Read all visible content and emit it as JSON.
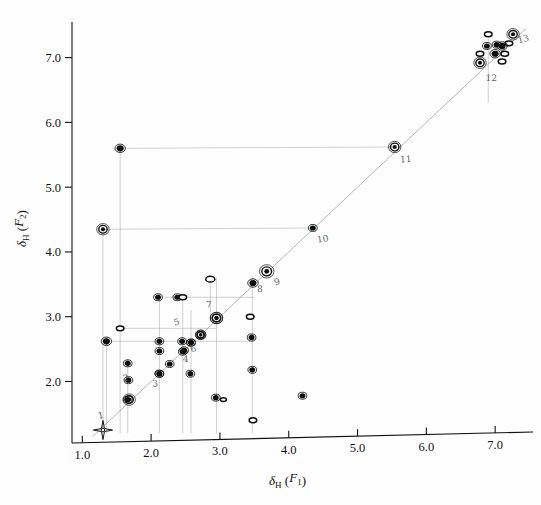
{
  "figure": {
    "background_color": "#fefefe",
    "ink_color": "#0d0d0d",
    "guide_color": "#9a9a9a",
    "width": 541,
    "height": 505
  },
  "axes": {
    "x": {
      "label_main": "δ",
      "label_sub": "H",
      "label_paren_open": " (",
      "label_italic": "F",
      "label_italic_sub": "1",
      "label_paren_close": ")",
      "label_text": "δH (F1)",
      "ticks": [
        "1.0",
        "2.0",
        "3.0",
        "4.0",
        "5.0",
        "6.0",
        "7.0"
      ],
      "tick_values": [
        1.0,
        2.0,
        3.0,
        4.0,
        5.0,
        6.0,
        7.0
      ],
      "range": [
        0.85,
        7.55
      ]
    },
    "y": {
      "label_main": "δ",
      "label_sub": "H",
      "label_paren_open": " (",
      "label_italic": "F",
      "label_italic_sub": "2",
      "label_paren_close": ")",
      "label_text": "δH (F2)",
      "ticks": [
        "7.0",
        "6.0",
        "5.0",
        "4.0",
        "3.0",
        "2.0"
      ],
      "tick_values": [
        7.0,
        6.0,
        5.0,
        4.0,
        3.0,
        2.0
      ],
      "range": [
        1.05,
        7.55
      ]
    }
  },
  "chart_data": {
    "type": "scatter",
    "xlabel": "δH (F1)",
    "ylabel": "δH (F2)",
    "xlim": [
      0.85,
      7.55
    ],
    "ylim": [
      1.05,
      7.55
    ],
    "grid": false,
    "legend": null,
    "diagonal": {
      "from": [
        1.15,
        1.15
      ],
      "to": [
        7.45,
        7.45
      ]
    },
    "series": [
      {
        "name": "diagonal-peaks",
        "style": "filled-ring",
        "points": [
          {
            "x": 1.3,
            "y": 1.25,
            "size": 9,
            "kind": "star"
          },
          {
            "x": 1.68,
            "y": 1.72,
            "size": 6,
            "kind": "ring"
          },
          {
            "x": 2.12,
            "y": 2.12,
            "size": 5,
            "kind": "solid"
          },
          {
            "x": 2.27,
            "y": 2.27,
            "size": 5,
            "kind": "solid"
          },
          {
            "x": 2.46,
            "y": 2.46,
            "size": 5,
            "kind": "solid"
          },
          {
            "x": 2.58,
            "y": 2.6,
            "size": 5,
            "kind": "solid"
          },
          {
            "x": 2.72,
            "y": 2.72,
            "size": 5,
            "kind": "ring"
          },
          {
            "x": 2.95,
            "y": 2.98,
            "size": 6,
            "kind": "ring"
          },
          {
            "x": 3.48,
            "y": 3.52,
            "size": 6,
            "kind": "solid"
          },
          {
            "x": 3.68,
            "y": 3.7,
            "size": 7,
            "kind": "ring"
          },
          {
            "x": 4.35,
            "y": 4.37,
            "size": 5,
            "kind": "solid",
            "label": "10"
          },
          {
            "x": 5.54,
            "y": 5.62,
            "size": 6,
            "kind": "ring",
            "label": "11"
          },
          {
            "x": 6.78,
            "y": 6.92,
            "size": 6,
            "kind": "ring",
            "label": "12"
          },
          {
            "x": 7.0,
            "y": 7.06,
            "size": 6,
            "kind": "solid"
          },
          {
            "x": 7.1,
            "y": 7.18,
            "size": 6,
            "kind": "solid"
          },
          {
            "x": 7.26,
            "y": 7.36,
            "size": 6,
            "kind": "ring"
          }
        ]
      },
      {
        "name": "cross-peaks",
        "style": "contour",
        "points": [
          {
            "x": 1.3,
            "y": 4.35,
            "size": 6,
            "kind": "ring"
          },
          {
            "x": 1.55,
            "y": 5.6,
            "size": 6,
            "kind": "solid"
          },
          {
            "x": 1.55,
            "y": 2.82,
            "size": 5,
            "kind": "open"
          },
          {
            "x": 1.35,
            "y": 2.62,
            "size": 6,
            "kind": "solid"
          },
          {
            "x": 1.66,
            "y": 2.28,
            "size": 5,
            "kind": "solid"
          },
          {
            "x": 1.67,
            "y": 2.02,
            "size": 5,
            "kind": "solid"
          },
          {
            "x": 1.66,
            "y": 1.72,
            "size": 5,
            "kind": "solid"
          },
          {
            "x": 2.1,
            "y": 3.3,
            "size": 5,
            "kind": "solid"
          },
          {
            "x": 2.12,
            "y": 2.62,
            "size": 5,
            "kind": "solid"
          },
          {
            "x": 2.12,
            "y": 2.47,
            "size": 5,
            "kind": "solid"
          },
          {
            "x": 2.12,
            "y": 2.12,
            "size": 5,
            "kind": "solid"
          },
          {
            "x": 2.38,
            "y": 3.3,
            "size": 5,
            "kind": "solid"
          },
          {
            "x": 2.46,
            "y": 3.3,
            "size": 5,
            "kind": "open"
          },
          {
            "x": 2.45,
            "y": 2.62,
            "size": 5,
            "kind": "solid"
          },
          {
            "x": 2.48,
            "y": 2.48,
            "size": 5,
            "kind": "solid"
          },
          {
            "x": 2.58,
            "y": 2.6,
            "size": 5,
            "kind": "solid"
          },
          {
            "x": 2.57,
            "y": 2.12,
            "size": 5,
            "kind": "solid"
          },
          {
            "x": 2.72,
            "y": 2.72,
            "size": 5,
            "kind": "ring"
          },
          {
            "x": 2.86,
            "y": 3.58,
            "size": 6,
            "kind": "open"
          },
          {
            "x": 2.95,
            "y": 2.98,
            "size": 6,
            "kind": "ring"
          },
          {
            "x": 2.94,
            "y": 1.75,
            "size": 5,
            "kind": "solid"
          },
          {
            "x": 3.05,
            "y": 1.72,
            "size": 4,
            "kind": "open"
          },
          {
            "x": 3.44,
            "y": 3.0,
            "size": 5,
            "kind": "open"
          },
          {
            "x": 3.46,
            "y": 2.68,
            "size": 5,
            "kind": "solid"
          },
          {
            "x": 3.47,
            "y": 2.18,
            "size": 5,
            "kind": "solid"
          },
          {
            "x": 3.48,
            "y": 1.4,
            "size": 5,
            "kind": "open"
          },
          {
            "x": 4.2,
            "y": 1.78,
            "size": 5,
            "kind": "solid"
          },
          {
            "x": 6.78,
            "y": 7.06,
            "size": 5,
            "kind": "open"
          },
          {
            "x": 6.88,
            "y": 7.18,
            "size": 5,
            "kind": "solid"
          },
          {
            "x": 6.9,
            "y": 7.36,
            "size": 5,
            "kind": "open"
          },
          {
            "x": 7.02,
            "y": 7.2,
            "size": 5,
            "kind": "solid"
          },
          {
            "x": 7.14,
            "y": 7.06,
            "size": 5,
            "kind": "open"
          },
          {
            "x": 7.1,
            "y": 6.94,
            "size": 5,
            "kind": "open"
          },
          {
            "x": 7.2,
            "y": 7.22,
            "size": 5,
            "kind": "open"
          }
        ]
      }
    ],
    "correlation_lines": [
      {
        "from": [
          1.3,
          4.35
        ],
        "to": [
          4.35,
          4.37
        ],
        "orientation": "horizontal"
      },
      {
        "from": [
          1.55,
          5.6
        ],
        "to": [
          5.54,
          5.62
        ],
        "orientation": "horizontal"
      },
      {
        "from": [
          1.55,
          5.6
        ],
        "to": [
          1.55,
          1.2
        ],
        "orientation": "vertical"
      },
      {
        "from": [
          1.3,
          4.35
        ],
        "to": [
          1.3,
          1.2
        ],
        "orientation": "vertical"
      },
      {
        "from": [
          1.55,
          2.82
        ],
        "to": [
          2.95,
          2.82
        ],
        "orientation": "horizontal"
      },
      {
        "from": [
          1.35,
          2.62
        ],
        "to": [
          3.5,
          2.62
        ],
        "orientation": "horizontal"
      },
      {
        "from": [
          2.1,
          3.3
        ],
        "to": [
          3.5,
          3.3
        ],
        "orientation": "horizontal"
      },
      {
        "from": [
          2.86,
          3.58
        ],
        "to": [
          2.86,
          2.95
        ],
        "orientation": "vertical"
      },
      {
        "from": [
          2.12,
          3.35
        ],
        "to": [
          2.12,
          1.2
        ],
        "orientation": "vertical"
      },
      {
        "from": [
          2.46,
          3.35
        ],
        "to": [
          2.46,
          1.2
        ],
        "orientation": "vertical"
      },
      {
        "from": [
          2.58,
          3.1
        ],
        "to": [
          2.58,
          1.2
        ],
        "orientation": "vertical"
      },
      {
        "from": [
          2.95,
          3.6
        ],
        "to": [
          2.95,
          1.2
        ],
        "orientation": "vertical"
      },
      {
        "from": [
          3.47,
          3.62
        ],
        "to": [
          3.47,
          1.2
        ],
        "orientation": "vertical"
      },
      {
        "from": [
          1.66,
          2.35
        ],
        "to": [
          1.66,
          1.2
        ],
        "orientation": "vertical"
      },
      {
        "from": [
          1.35,
          2.7
        ],
        "to": [
          1.35,
          1.2
        ],
        "orientation": "vertical"
      },
      {
        "from": [
          6.9,
          7.4
        ],
        "to": [
          6.9,
          6.3
        ],
        "orientation": "vertical"
      }
    ],
    "annotations": [
      {
        "text": "1",
        "x": 1.24,
        "y": 1.42
      },
      {
        "text": "2",
        "x": 1.6,
        "y": 2.0
      },
      {
        "text": "3",
        "x": 2.02,
        "y": 1.92
      },
      {
        "text": "4",
        "x": 2.46,
        "y": 2.3
      },
      {
        "text": "5",
        "x": 2.34,
        "y": 2.86
      },
      {
        "text": "6",
        "x": 2.58,
        "y": 2.45
      },
      {
        "text": "7",
        "x": 2.8,
        "y": 3.14
      },
      {
        "text": "8",
        "x": 3.54,
        "y": 3.38
      },
      {
        "text": "9",
        "x": 3.8,
        "y": 3.48
      },
      {
        "text": "10",
        "x": 4.42,
        "y": 4.14
      },
      {
        "text": "11",
        "x": 5.62,
        "y": 5.38
      },
      {
        "text": "12",
        "x": 6.86,
        "y": 6.64
      },
      {
        "text": "13",
        "x": 7.34,
        "y": 7.22
      }
    ]
  }
}
